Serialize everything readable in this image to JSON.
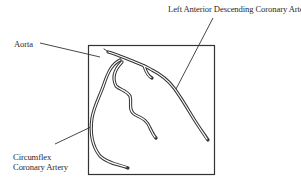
{
  "diagram": {
    "type": "anatomical line drawing (coronary angiogram schematic)",
    "labels": {
      "lad": "Left Anterior Descending Coronary Artery.",
      "aorta": "Aorta",
      "circumflex_line1": "Circumflex",
      "circumflex_line2": "Coronary Artery"
    },
    "nodes": [
      {
        "id": "aorta",
        "label": "Aorta"
      },
      {
        "id": "lad",
        "label": "Left Anterior Descending Coronary Artery."
      },
      {
        "id": "circumflex",
        "label": "Circumflex Coronary Artery"
      }
    ],
    "edges": [
      {
        "from": "aorta",
        "to": "vessel-origin",
        "kind": "leader-line"
      },
      {
        "from": "lad",
        "to": "lad-vessel",
        "kind": "leader-line"
      },
      {
        "from": "circumflex",
        "to": "circumflex-vessel",
        "kind": "leader-line"
      }
    ],
    "colors": {
      "ink": "#2a2a2a",
      "background": "#ffffff"
    }
  }
}
